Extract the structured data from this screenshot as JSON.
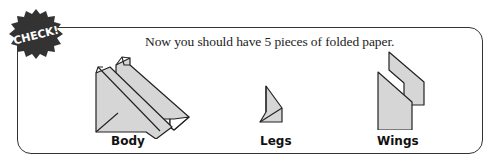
{
  "badge": {
    "text": "CHECK!",
    "color": "#333333",
    "text_color": "#ffffff",
    "icon": "starburst-badge-icon"
  },
  "instruction": "Now you should have 5 pieces of folded paper.",
  "pieces": [
    {
      "label": "Body",
      "icon": "folded-paper-body-icon"
    },
    {
      "label": "Legs",
      "icon": "folded-paper-legs-icon"
    },
    {
      "label": "Wings",
      "icon": "folded-paper-wings-icon"
    }
  ],
  "colors": {
    "paper_fill": "#d6d6d6",
    "outline": "#222222",
    "frame_border": "#333333"
  }
}
